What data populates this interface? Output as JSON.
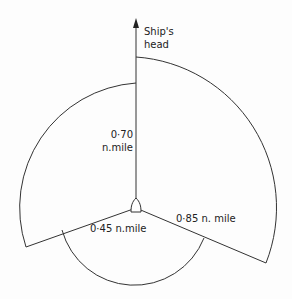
{
  "diagram": {
    "heading_label_line1": "Ship's",
    "heading_label_line2": "head",
    "forward_left_range_line1": "0·70",
    "forward_left_range_line2": "n.mile",
    "starboard_range": "0·85 n. mile",
    "astern_range": "0·45 n.mile",
    "stroke_color": "#333333"
  }
}
